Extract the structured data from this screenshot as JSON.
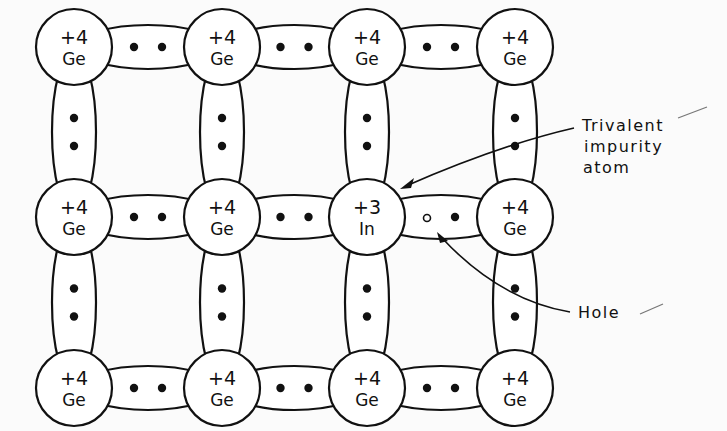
{
  "figure": {
    "lattice": {
      "columns": 4,
      "rows": 3,
      "atoms": [
        [
          {
            "charge": "+4",
            "element": "Ge"
          },
          {
            "charge": "+4",
            "element": "Ge"
          },
          {
            "charge": "+4",
            "element": "Ge"
          },
          {
            "charge": "+4",
            "element": "Ge"
          }
        ],
        [
          {
            "charge": "+4",
            "element": "Ge"
          },
          {
            "charge": "+4",
            "element": "Ge"
          },
          {
            "charge": "+3",
            "element": "In"
          },
          {
            "charge": "+4",
            "element": "Ge"
          }
        ],
        [
          {
            "charge": "+4",
            "element": "Ge"
          },
          {
            "charge": "+4",
            "element": "Ge"
          },
          {
            "charge": "+4",
            "element": "Ge"
          },
          {
            "charge": "+4",
            "element": "Ge"
          }
        ]
      ],
      "bond_electrons_per_bond": 2,
      "hole_location": "bond between In (row 2, col 3) and Ge (row 2, col 4)"
    },
    "annotations": {
      "impurity_label_line1": "Trivalent",
      "impurity_label_line2": "impurity",
      "impurity_label_line3": "atom",
      "hole_label": "Hole"
    },
    "colors": {
      "ink": "#111111",
      "paper": "#fbfbfb"
    }
  }
}
